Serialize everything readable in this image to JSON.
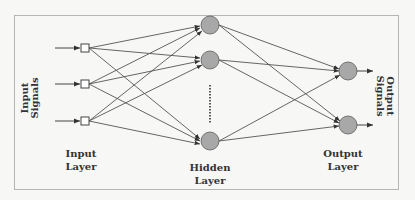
{
  "diagram": {
    "type": "feedforward-neural-network",
    "labels": {
      "input_signals": "Input Signals",
      "input_signals_line1": "Input",
      "input_signals_line2": "Signals",
      "output_signals": "Output Signals",
      "output_signals_line1": "Output",
      "output_signals_line2": "Signals",
      "input_layer_line1": "Input",
      "input_layer_line2": "Layer",
      "hidden_layer_line1": "Hidden",
      "hidden_layer_line2": "Layer",
      "output_layer_line1": "Output",
      "output_layer_line2": "Layer"
    },
    "layers": [
      {
        "name": "Input Layer",
        "node_shape": "square",
        "node_count": 3
      },
      {
        "name": "Hidden Layer",
        "node_shape": "circle",
        "node_count_visible": 3,
        "ellipsis": true
      },
      {
        "name": "Output Layer",
        "node_shape": "circle",
        "node_count": 2
      }
    ],
    "connections": "fully-connected",
    "colors": {
      "background": "#f7f7f5",
      "frame": "#b0b0b0",
      "edge": "#444444",
      "node_fill": "#a8a8a8",
      "node_stroke": "#555555",
      "input_node_fill": "#ffffff",
      "text": "#333333"
    }
  }
}
